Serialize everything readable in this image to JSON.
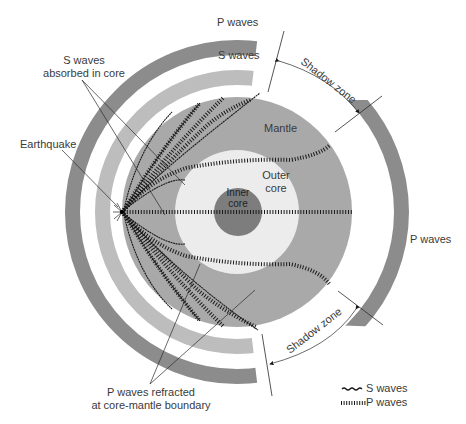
{
  "diagram": {
    "center": [
      237,
      212
    ],
    "colors": {
      "p_band": "#8c8c8c",
      "s_band": "#bdbdbd",
      "mantle": "#a9a9a9",
      "outer_core": "#ececec",
      "inner_core": "#7d7d7d",
      "wave_line": "#1a1a1a",
      "text": "#3a3a3a"
    },
    "layers": {
      "mantle_label": "Mantle",
      "outer_core_label_1": "Outer",
      "outer_core_label_2": "core",
      "inner_core_label_1": "Inner",
      "inner_core_label_2": "core"
    },
    "labels": {
      "p_waves_top": "P waves",
      "s_waves_top": "S waves",
      "p_waves_right": "P waves",
      "s_absorbed_1": "S waves",
      "s_absorbed_2": "absorbed in core",
      "earthquake": "Earthquake",
      "shadow_zone_top": "Shadow zone",
      "shadow_zone_bottom": "Shadow zone",
      "p_refracted_1": "P waves refracted",
      "p_refracted_2": "at core-mantle boundary"
    },
    "legend": {
      "s_waves": "S waves",
      "p_waves": "P waves"
    }
  }
}
